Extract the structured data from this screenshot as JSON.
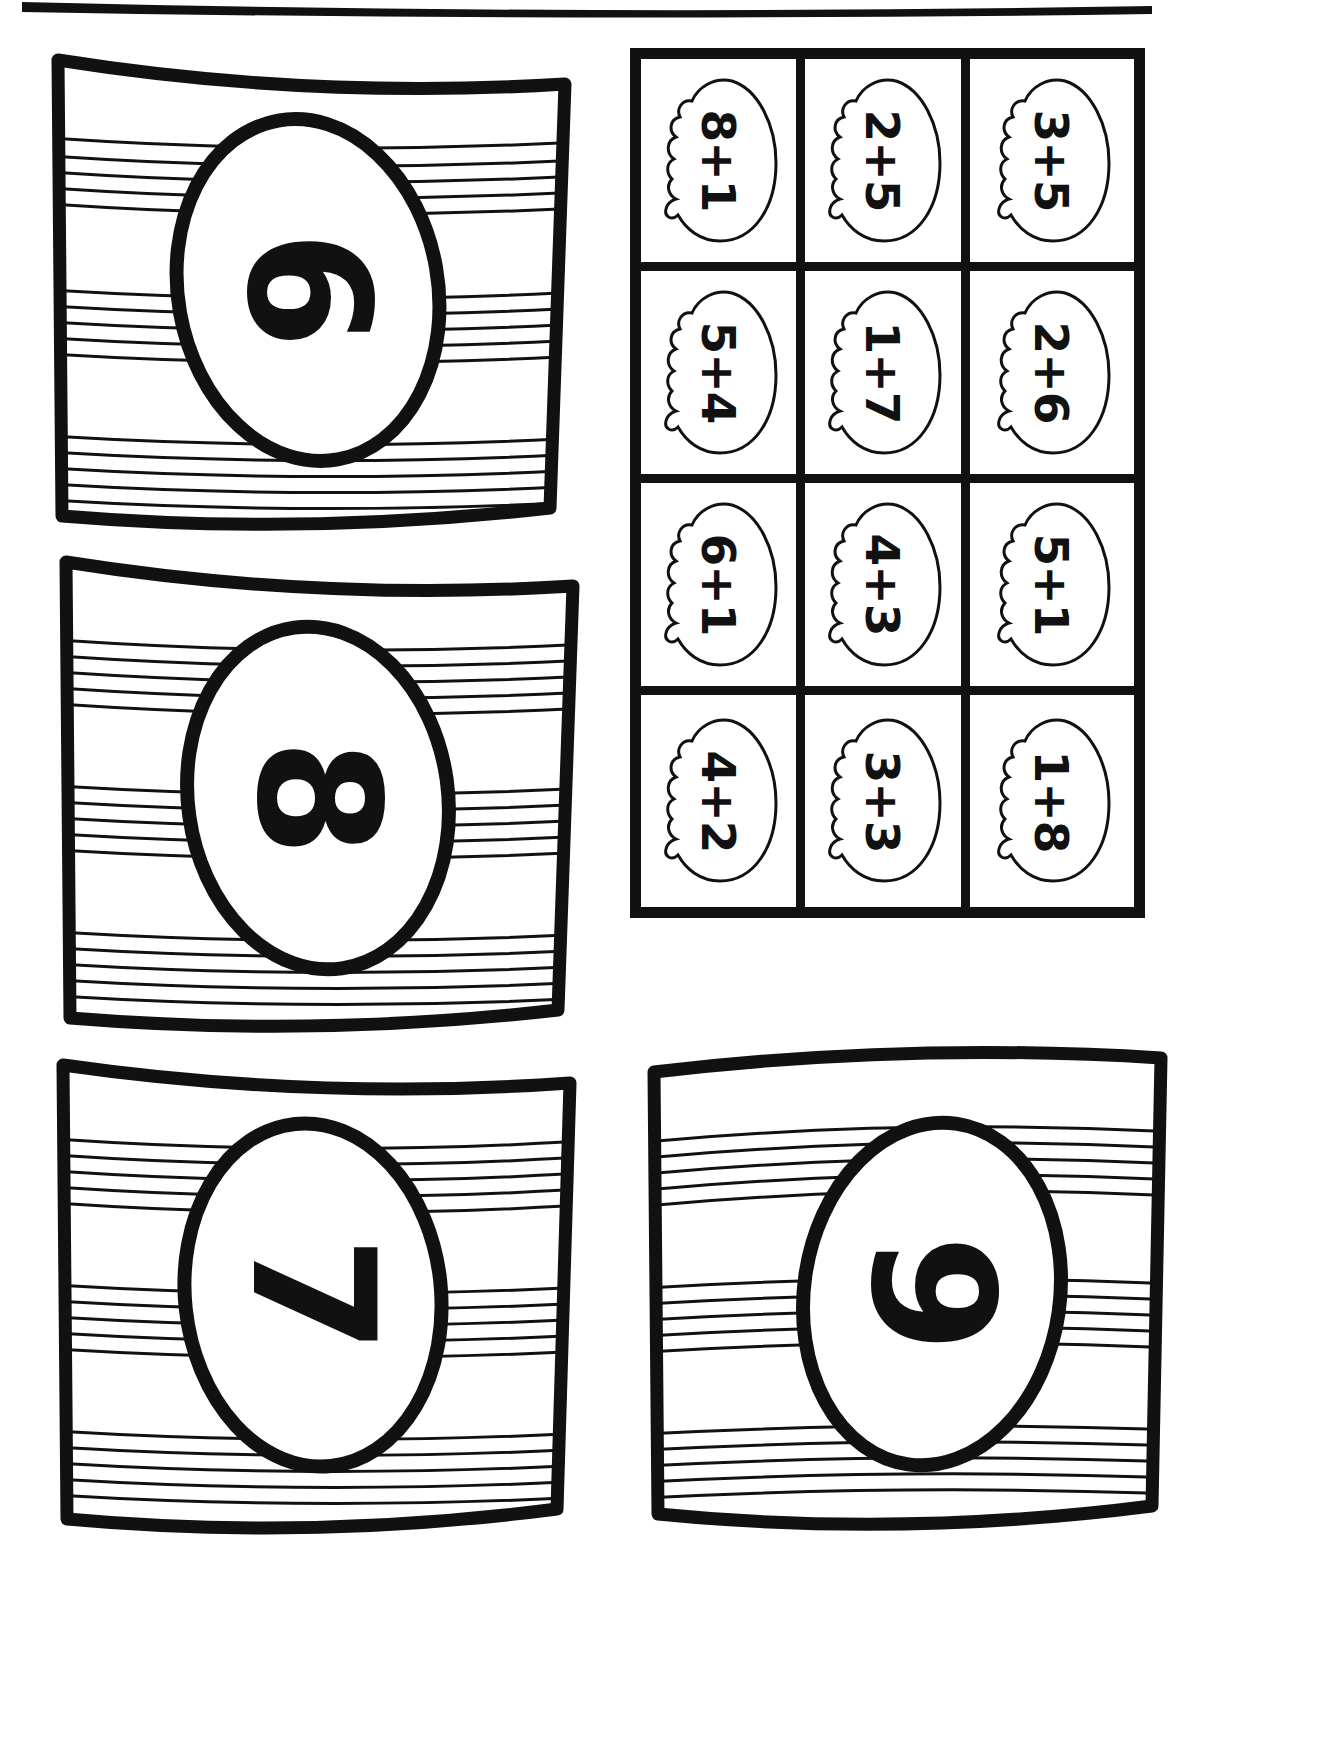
{
  "worksheet": {
    "title": "Easter Egg Addition Sums Matching Worksheet",
    "page_orientation": "rotated-90",
    "ink_color": "#111111",
    "background_color": "#ffffff"
  },
  "answer_cards": [
    {
      "id": "card-6",
      "number": "6",
      "position": "top-left"
    },
    {
      "id": "card-8",
      "number": "8",
      "position": "middle-left"
    },
    {
      "id": "card-7",
      "number": "7",
      "position": "bottom-left"
    },
    {
      "id": "card-9",
      "number": "9",
      "position": "bottom-right"
    }
  ],
  "cut_grid": {
    "rows": 4,
    "columns": 3,
    "cells": [
      {
        "row": 1,
        "col": 1,
        "expression": "8+1"
      },
      {
        "row": 1,
        "col": 2,
        "expression": "2+5"
      },
      {
        "row": 1,
        "col": 3,
        "expression": "3+5"
      },
      {
        "row": 2,
        "col": 1,
        "expression": "5+4"
      },
      {
        "row": 2,
        "col": 2,
        "expression": "1+7"
      },
      {
        "row": 2,
        "col": 3,
        "expression": "2+6"
      },
      {
        "row": 3,
        "col": 1,
        "expression": "6+1"
      },
      {
        "row": 3,
        "col": 2,
        "expression": "4+3"
      },
      {
        "row": 3,
        "col": 3,
        "expression": "5+1"
      },
      {
        "row": 4,
        "col": 1,
        "expression": "4+2"
      },
      {
        "row": 4,
        "col": 2,
        "expression": "3+3"
      },
      {
        "row": 4,
        "col": 3,
        "expression": "1+8"
      }
    ]
  }
}
